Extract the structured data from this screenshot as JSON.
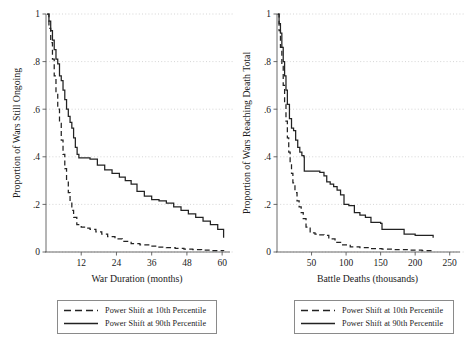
{
  "figure": {
    "panels": [
      {
        "id": "war-duration",
        "xlabel": "War Duration (months)",
        "ylabel": "Proportion of Wars Still Ongoing",
        "xticks": [
          "12",
          "24",
          "36",
          "48",
          "60"
        ],
        "yticks": [
          "0",
          ".2",
          ".4",
          ".6",
          ".8",
          "1"
        ]
      },
      {
        "id": "battle-deaths",
        "xlabel": "Battle Deaths (thousands)",
        "ylabel": "Proportion of Wars Reaching Death Total",
        "xticks": [
          "50",
          "100",
          "150",
          "200",
          "250"
        ],
        "yticks": [
          "0",
          ".2",
          ".4",
          ".6",
          ".8",
          "1"
        ]
      }
    ],
    "legend": {
      "items": [
        {
          "key": "dashed-line-key",
          "label": "Power Shift at 10th Percentile"
        },
        {
          "key": "solid-line-key",
          "label": "Power Shift at 90th Percentile"
        }
      ]
    }
  },
  "chart_data": [
    {
      "type": "line",
      "id": "war-duration",
      "title": "",
      "xlabel": "War Duration (months)",
      "ylabel": "Proportion of Wars Still Ongoing",
      "xlim": [
        0,
        62
      ],
      "ylim": [
        0,
        1
      ],
      "xticks": [
        12,
        24,
        36,
        48,
        60
      ],
      "yticks": [
        0,
        0.2,
        0.4,
        0.6,
        0.8,
        1
      ],
      "grid": true,
      "legend_position": "below",
      "step": "post",
      "series": [
        {
          "name": "Power Shift at 90th Percentile",
          "style": "solid",
          "x": [
            0.4,
            1.0,
            1.6,
            2.2,
            2.8,
            3.4,
            4.0,
            4.6,
            5.2,
            5.8,
            6.4,
            7.0,
            7.6,
            8.2,
            8.8,
            9.4,
            10.0,
            10.6,
            11.2,
            12.5,
            15.0,
            17.5,
            20.0,
            22.5,
            25.0,
            27.0,
            29.0,
            31.0,
            33.5,
            36.0,
            38.5,
            41.0,
            43.5,
            46.0,
            48.5,
            51.0,
            53.5,
            56.0,
            58.5,
            60.5
          ],
          "y": [
            1.0,
            0.97,
            0.93,
            0.89,
            0.85,
            0.81,
            0.79,
            0.74,
            0.72,
            0.68,
            0.64,
            0.6,
            0.57,
            0.545,
            0.52,
            0.48,
            0.44,
            0.41,
            0.395,
            0.395,
            0.39,
            0.365,
            0.345,
            0.33,
            0.315,
            0.3,
            0.285,
            0.255,
            0.235,
            0.22,
            0.215,
            0.205,
            0.19,
            0.175,
            0.16,
            0.145,
            0.13,
            0.115,
            0.095,
            0.06
          ]
        },
        {
          "name": "Power Shift at 10th Percentile",
          "style": "dashed",
          "x": [
            0.4,
            1.0,
            1.6,
            2.2,
            2.8,
            3.4,
            4.0,
            4.6,
            5.2,
            5.8,
            6.4,
            7.0,
            7.6,
            8.2,
            8.8,
            9.4,
            10.5,
            12.0,
            13.5,
            15.0,
            17.0,
            19.0,
            21.0,
            23.5,
            26.0,
            29.0,
            32.0,
            35.0,
            38.0,
            41.0,
            44.0,
            47.0,
            50.0,
            53.0,
            56.0,
            60.5
          ],
          "y": [
            1.0,
            0.94,
            0.88,
            0.81,
            0.74,
            0.67,
            0.6,
            0.54,
            0.47,
            0.41,
            0.35,
            0.3,
            0.25,
            0.21,
            0.175,
            0.145,
            0.115,
            0.105,
            0.1,
            0.095,
            0.085,
            0.075,
            0.065,
            0.055,
            0.045,
            0.035,
            0.03,
            0.025,
            0.02,
            0.018,
            0.015,
            0.012,
            0.01,
            0.008,
            0.006,
            0.004
          ]
        }
      ]
    },
    {
      "type": "line",
      "id": "battle-deaths",
      "title": "",
      "xlabel": "Battle Deaths (thousands)",
      "ylabel": "Proportion of Wars Reaching Death Total",
      "xlim": [
        0,
        262
      ],
      "ylim": [
        0,
        1
      ],
      "xticks": [
        50,
        100,
        150,
        200,
        250
      ],
      "yticks": [
        0,
        0.2,
        0.4,
        0.6,
        0.8,
        1
      ],
      "grid": true,
      "legend_position": "below",
      "step": "post",
      "series": [
        {
          "name": "Power Shift at 90th Percentile",
          "style": "solid",
          "x": [
            1,
            3,
            5,
            7,
            9,
            11,
            13,
            15,
            18,
            21,
            24,
            27,
            30,
            33,
            36,
            39,
            39.5,
            56,
            62,
            68,
            72,
            77,
            82,
            87,
            92,
            97,
            104,
            112,
            120,
            128,
            136,
            150,
            152,
            168,
            184,
            200,
            226
          ],
          "y": [
            1.0,
            0.96,
            0.92,
            0.86,
            0.8,
            0.74,
            0.68,
            0.62,
            0.56,
            0.52,
            0.51,
            0.47,
            0.44,
            0.42,
            0.405,
            0.4,
            0.34,
            0.34,
            0.335,
            0.32,
            0.295,
            0.285,
            0.275,
            0.26,
            0.24,
            0.2,
            0.195,
            0.165,
            0.155,
            0.145,
            0.125,
            0.12,
            0.095,
            0.095,
            0.075,
            0.07,
            0.06
          ]
        },
        {
          "name": "Power Shift at 10th Percentile",
          "style": "dashed",
          "x": [
            1,
            3,
            5,
            7,
            9,
            11,
            13,
            15,
            17,
            19,
            21,
            23,
            26,
            29,
            32,
            35,
            38,
            42,
            48,
            55,
            62,
            68,
            75,
            84,
            94,
            106,
            120,
            136,
            152,
            170,
            190,
            210,
            226
          ],
          "y": [
            1.0,
            0.93,
            0.86,
            0.78,
            0.7,
            0.62,
            0.55,
            0.48,
            0.42,
            0.37,
            0.33,
            0.29,
            0.25,
            0.215,
            0.19,
            0.165,
            0.14,
            0.105,
            0.08,
            0.075,
            0.072,
            0.07,
            0.055,
            0.04,
            0.03,
            0.022,
            0.018,
            0.014,
            0.012,
            0.01,
            0.008,
            0.006,
            0.005
          ]
        }
      ]
    }
  ]
}
